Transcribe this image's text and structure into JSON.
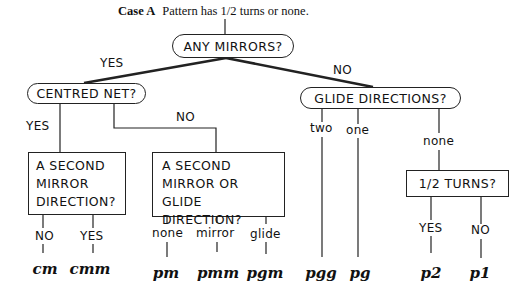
{
  "caption": {
    "bold": "Case A",
    "text": "Pattern has 1/2 turns or none."
  },
  "nodes": {
    "any_mirrors": "ANY MIRRORS?",
    "centred_net": "CENTRED NET?",
    "glide_directions": "GLIDE DIRECTIONS?",
    "second_mirror": [
      "A SECOND",
      "MIRROR",
      "DIRECTION?"
    ],
    "second_mirror_or_glide": [
      "A SECOND",
      "MIRROR OR GLIDE",
      "DIRECTION?"
    ],
    "half_turns": "1/2 TURNS?"
  },
  "edges": {
    "any_mirrors_yes": "YES",
    "any_mirrors_no": "NO",
    "centred_yes": "YES",
    "centred_no": "NO",
    "glide_two": "two",
    "glide_one": "one",
    "glide_none": "none",
    "second_mirror_no": "NO",
    "second_mirror_yes": "YES",
    "smg_none": "none",
    "smg_mirror": "mirror",
    "smg_glide": "glide",
    "turns_yes": "YES",
    "turns_no": "NO"
  },
  "groups": [
    "cm",
    "cmm",
    "pm",
    "pmm",
    "pgm",
    "pgg",
    "pg",
    "p2",
    "p1"
  ]
}
